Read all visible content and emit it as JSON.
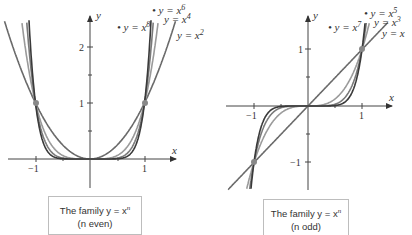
{
  "chart_data": [
    {
      "type": "line",
      "title": "The family y = x^n (n even)",
      "caption_line1": "The family y = x",
      "caption_sup": "n",
      "caption_line2": "(n even)",
      "xlabel": "x",
      "ylabel": "y",
      "x_ticks": [
        "−1",
        "1"
      ],
      "y_ticks": [
        "1",
        "2"
      ],
      "xlim": [
        -1.6,
        1.6
      ],
      "ylim": [
        -0.7,
        2.5
      ],
      "grid": false,
      "series": [
        {
          "name": "y = x^2",
          "label": "y = x",
          "exp": "2",
          "n": 2,
          "color": "#6a6a6a"
        },
        {
          "name": "y = x^4",
          "label": "y = x",
          "exp": "4",
          "n": 4,
          "color": "#9a9a9a"
        },
        {
          "name": "y = x^6",
          "label": "y = x",
          "exp": "6",
          "n": 6,
          "color": "#7a7a7a"
        },
        {
          "name": "y = x^8",
          "label": "y = x",
          "exp": "8",
          "n": 8,
          "color": "#3a3a3a"
        }
      ],
      "marked_points": [
        [
          -1,
          1
        ],
        [
          1,
          1
        ]
      ]
    },
    {
      "type": "line",
      "title": "The family y = x^n (n odd)",
      "caption_line1": "The family y = x",
      "caption_sup": "n",
      "caption_line2": "(n odd)",
      "xlabel": "x",
      "ylabel": "y",
      "x_ticks": [
        "−1",
        "1"
      ],
      "y_ticks": [
        "1",
        "−1"
      ],
      "xlim": [
        -1.5,
        1.7
      ],
      "ylim": [
        -1.6,
        1.5
      ],
      "grid": false,
      "series": [
        {
          "name": "y = x",
          "label": "y = x",
          "exp": "",
          "n": 1,
          "color": "#6a6a6a"
        },
        {
          "name": "y = x^3",
          "label": "y = x",
          "exp": "3",
          "n": 3,
          "color": "#9a9a9a"
        },
        {
          "name": "y = x^5",
          "label": "y = x",
          "exp": "5",
          "n": 5,
          "color": "#7a7a7a"
        },
        {
          "name": "y = x^7",
          "label": "y = x",
          "exp": "7",
          "n": 7,
          "color": "#3a3a3a"
        }
      ],
      "marked_points": [
        [
          -1,
          -1
        ],
        [
          1,
          1
        ]
      ]
    }
  ]
}
